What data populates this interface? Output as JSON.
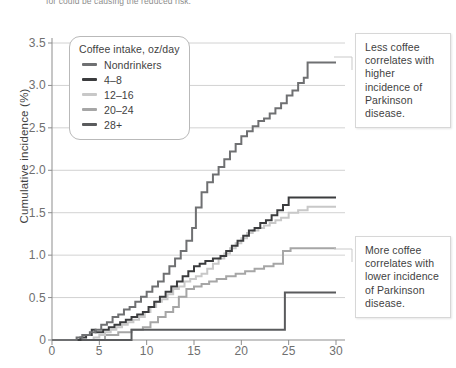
{
  "figure": {
    "cut_caption": "for could be causing the reduced risk.",
    "background": "#ffffff"
  },
  "axes": {
    "ylabel": "Cumulative incidence (%)",
    "yticks": [
      "3.5",
      "3.0",
      "2.5",
      "2.0",
      "1.5",
      "1.0",
      "0.5",
      "0"
    ],
    "xticks": [
      "0",
      "5",
      "10",
      "15",
      "20",
      "25",
      "30"
    ]
  },
  "legend": {
    "title": "Coffee intake, oz/day",
    "items": [
      {
        "label": "Nondrinkers",
        "color": "#6f7072"
      },
      {
        "label": "4–8",
        "color": "#3b3c3e"
      },
      {
        "label": "12–16",
        "color": "#c8c8c8"
      },
      {
        "label": "20–24",
        "color": "#a6a6a6"
      },
      {
        "label": "28+",
        "color": "#5a5b5d"
      }
    ]
  },
  "annotations": [
    {
      "id": "top",
      "text": "Less coffee correlates with higher incidence of Parkinson disease."
    },
    {
      "id": "bottom",
      "text": "More coffee correlates with lower incidence of Parkinson disease."
    }
  ],
  "chart_data": {
    "type": "line",
    "subtype": "step",
    "title": "",
    "xlabel": "",
    "ylabel": "Cumulative incidence (%)",
    "xlim": [
      0,
      30
    ],
    "ylim": [
      0,
      3.5
    ],
    "xticks": [
      0,
      5,
      10,
      15,
      20,
      25,
      30
    ],
    "yticks": [
      0,
      0.5,
      1.0,
      1.5,
      2.0,
      2.5,
      3.0,
      3.5
    ],
    "grid": "horizontal",
    "legend_position": "upper-left-inside",
    "legend_title": "Coffee intake, oz/day",
    "series": [
      {
        "name": "Nondrinkers",
        "color": "#6f7072",
        "final_value": 3.27,
        "points": [
          [
            0,
            0
          ],
          [
            2.6,
            0.03
          ],
          [
            3.2,
            0.06
          ],
          [
            4.0,
            0.09
          ],
          [
            4.6,
            0.12
          ],
          [
            5.2,
            0.18
          ],
          [
            5.8,
            0.21
          ],
          [
            6.4,
            0.27
          ],
          [
            7.0,
            0.3
          ],
          [
            7.6,
            0.36
          ],
          [
            8.2,
            0.39
          ],
          [
            8.8,
            0.45
          ],
          [
            9.4,
            0.51
          ],
          [
            10.0,
            0.57
          ],
          [
            10.6,
            0.63
          ],
          [
            11.2,
            0.69
          ],
          [
            11.8,
            0.78
          ],
          [
            12.4,
            0.87
          ],
          [
            13.0,
            0.96
          ],
          [
            13.6,
            1.05
          ],
          [
            14.2,
            1.17
          ],
          [
            14.8,
            1.32
          ],
          [
            15.2,
            1.56
          ],
          [
            15.8,
            1.74
          ],
          [
            16.4,
            1.86
          ],
          [
            17.0,
            1.95
          ],
          [
            17.6,
            2.04
          ],
          [
            18.2,
            2.13
          ],
          [
            18.8,
            2.22
          ],
          [
            19.4,
            2.31
          ],
          [
            20.0,
            2.4
          ],
          [
            20.6,
            2.46
          ],
          [
            21.2,
            2.52
          ],
          [
            21.8,
            2.58
          ],
          [
            22.4,
            2.61
          ],
          [
            23.0,
            2.67
          ],
          [
            23.6,
            2.73
          ],
          [
            24.2,
            2.79
          ],
          [
            24.8,
            2.88
          ],
          [
            25.4,
            2.94
          ],
          [
            26.0,
            3.03
          ],
          [
            26.6,
            3.09
          ],
          [
            27.0,
            3.27
          ],
          [
            30,
            3.27
          ]
        ]
      },
      {
        "name": "4–8",
        "color": "#3b3c3e",
        "final_value": 1.68,
        "points": [
          [
            0,
            0
          ],
          [
            3.0,
            0.03
          ],
          [
            3.6,
            0.06
          ],
          [
            4.2,
            0.12
          ],
          [
            4.6,
            0.09
          ],
          [
            5.4,
            0.12
          ],
          [
            6.0,
            0.15
          ],
          [
            6.6,
            0.18
          ],
          [
            7.2,
            0.21
          ],
          [
            7.8,
            0.24
          ],
          [
            8.4,
            0.27
          ],
          [
            9.0,
            0.3
          ],
          [
            9.6,
            0.33
          ],
          [
            10.2,
            0.39
          ],
          [
            10.8,
            0.45
          ],
          [
            11.4,
            0.51
          ],
          [
            12.0,
            0.57
          ],
          [
            12.6,
            0.63
          ],
          [
            13.2,
            0.69
          ],
          [
            13.8,
            0.75
          ],
          [
            14.4,
            0.81
          ],
          [
            15.0,
            0.87
          ],
          [
            15.6,
            0.9
          ],
          [
            16.2,
            0.93
          ],
          [
            17.0,
            0.96
          ],
          [
            17.8,
            0.99
          ],
          [
            18.4,
            1.05
          ],
          [
            19.0,
            1.11
          ],
          [
            19.6,
            1.17
          ],
          [
            20.2,
            1.23
          ],
          [
            20.8,
            1.29
          ],
          [
            21.4,
            1.32
          ],
          [
            22.0,
            1.38
          ],
          [
            22.6,
            1.41
          ],
          [
            23.2,
            1.47
          ],
          [
            23.8,
            1.53
          ],
          [
            24.4,
            1.59
          ],
          [
            25.0,
            1.68
          ],
          [
            30,
            1.68
          ]
        ]
      },
      {
        "name": "12–16",
        "color": "#c8c8c8",
        "final_value": 1.57,
        "points": [
          [
            0,
            0
          ],
          [
            4.4,
            0.03
          ],
          [
            5.0,
            0.06
          ],
          [
            5.6,
            0.09
          ],
          [
            6.2,
            0.12
          ],
          [
            6.8,
            0.15
          ],
          [
            7.4,
            0.18
          ],
          [
            8.0,
            0.21
          ],
          [
            8.6,
            0.24
          ],
          [
            9.2,
            0.27
          ],
          [
            9.8,
            0.33
          ],
          [
            10.4,
            0.39
          ],
          [
            11.0,
            0.45
          ],
          [
            11.6,
            0.48
          ],
          [
            12.2,
            0.54
          ],
          [
            12.8,
            0.6
          ],
          [
            13.4,
            0.63
          ],
          [
            14.0,
            0.69
          ],
          [
            14.6,
            0.72
          ],
          [
            15.2,
            0.75
          ],
          [
            15.8,
            0.78
          ],
          [
            16.4,
            0.84
          ],
          [
            17.0,
            0.9
          ],
          [
            17.6,
            0.96
          ],
          [
            18.2,
            1.02
          ],
          [
            18.8,
            1.08
          ],
          [
            19.4,
            1.14
          ],
          [
            20.0,
            1.2
          ],
          [
            20.6,
            1.26
          ],
          [
            21.2,
            1.29
          ],
          [
            21.8,
            1.32
          ],
          [
            22.4,
            1.35
          ],
          [
            23.0,
            1.38
          ],
          [
            23.6,
            1.41
          ],
          [
            24.2,
            1.44
          ],
          [
            25.0,
            1.5
          ],
          [
            26.0,
            1.53
          ],
          [
            27.0,
            1.57
          ],
          [
            30,
            1.57
          ]
        ]
      },
      {
        "name": "20–24",
        "color": "#a6a6a6",
        "final_value": 1.08,
        "points": [
          [
            0,
            0
          ],
          [
            5.6,
            0.06
          ],
          [
            7.0,
            0.09
          ],
          [
            8.4,
            0.12
          ],
          [
            9.6,
            0.15
          ],
          [
            10.4,
            0.21
          ],
          [
            11.2,
            0.27
          ],
          [
            12.0,
            0.33
          ],
          [
            12.8,
            0.39
          ],
          [
            13.4,
            0.51
          ],
          [
            14.2,
            0.6
          ],
          [
            15.0,
            0.63
          ],
          [
            15.8,
            0.66
          ],
          [
            16.6,
            0.69
          ],
          [
            17.4,
            0.72
          ],
          [
            18.4,
            0.75
          ],
          [
            19.4,
            0.78
          ],
          [
            20.4,
            0.81
          ],
          [
            21.4,
            0.84
          ],
          [
            22.4,
            0.87
          ],
          [
            23.4,
            0.9
          ],
          [
            24.4,
            1.05
          ],
          [
            25.2,
            1.08
          ],
          [
            30,
            1.08
          ]
        ]
      },
      {
        "name": "28+",
        "color": "#5a5b5d",
        "final_value": 0.56,
        "points": [
          [
            0,
            0
          ],
          [
            8.4,
            0.12
          ],
          [
            24.4,
            0.12
          ],
          [
            24.6,
            0.56
          ],
          [
            30,
            0.56
          ]
        ]
      }
    ]
  }
}
